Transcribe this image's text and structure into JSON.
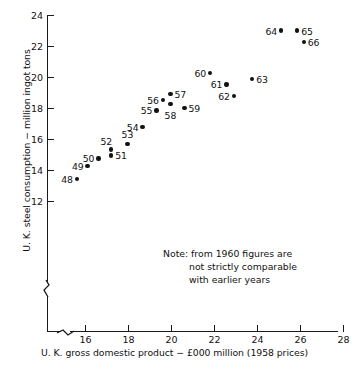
{
  "chart_data": {
    "type": "scatter",
    "title": "",
    "xlabel": "U. K. gross domestic product − £000 million (1958 prices)",
    "ylabel": "U. K. steel consumption − million ingot tons",
    "xlim": [
      15.0,
      28
    ],
    "ylim": [
      11.3,
      24
    ],
    "xticks": [
      16,
      18,
      20,
      22,
      24,
      26,
      28
    ],
    "yticks": [
      12,
      14,
      16,
      18,
      20,
      22,
      24
    ],
    "xtick_labels": [
      "16",
      "18",
      "20",
      "22",
      "24",
      "26",
      "28"
    ],
    "ytick_labels": [
      "12",
      "14",
      "16",
      "18",
      "20",
      "22",
      "24"
    ],
    "grid": false,
    "legend": null,
    "axis_break_x": true,
    "axis_break_y": true,
    "annotation": {
      "line1": "Note: from 1960 figures are",
      "line2": "not strictly comparable",
      "line3": "with earlier years"
    },
    "point_label_meaning": "two-digit year (19xx)",
    "points": [
      {
        "label": "48",
        "x": 15.6,
        "y": 13.45,
        "label_pos": "left"
      },
      {
        "label": "49",
        "x": 16.1,
        "y": 14.28,
        "label_pos": "left"
      },
      {
        "label": "50",
        "x": 16.6,
        "y": 14.78,
        "label_pos": "left"
      },
      {
        "label": "51",
        "x": 17.2,
        "y": 14.98,
        "label_pos": "right"
      },
      {
        "label": "52",
        "x": 17.2,
        "y": 15.35,
        "label_pos": "above-left"
      },
      {
        "label": "53",
        "x": 17.95,
        "y": 15.7,
        "label_pos": "above"
      },
      {
        "label": "54",
        "x": 18.65,
        "y": 16.82,
        "label_pos": "left"
      },
      {
        "label": "55",
        "x": 19.3,
        "y": 17.88,
        "label_pos": "left"
      },
      {
        "label": "56",
        "x": 19.6,
        "y": 18.55,
        "label_pos": "left"
      },
      {
        "label": "57",
        "x": 19.95,
        "y": 18.92,
        "label_pos": "right"
      },
      {
        "label": "58",
        "x": 19.95,
        "y": 18.28,
        "label_pos": "below"
      },
      {
        "label": "59",
        "x": 20.6,
        "y": 18.05,
        "label_pos": "right"
      },
      {
        "label": "60",
        "x": 21.8,
        "y": 20.28,
        "label_pos": "left"
      },
      {
        "label": "61",
        "x": 22.55,
        "y": 19.55,
        "label_pos": "left"
      },
      {
        "label": "62",
        "x": 22.9,
        "y": 18.82,
        "label_pos": "left"
      },
      {
        "label": "63",
        "x": 23.75,
        "y": 19.9,
        "label_pos": "right"
      },
      {
        "label": "64",
        "x": 25.1,
        "y": 23.02,
        "label_pos": "left"
      },
      {
        "label": "65",
        "x": 25.85,
        "y": 23.02,
        "label_pos": "right"
      },
      {
        "label": "66",
        "x": 26.15,
        "y": 22.28,
        "label_pos": "right"
      }
    ]
  }
}
